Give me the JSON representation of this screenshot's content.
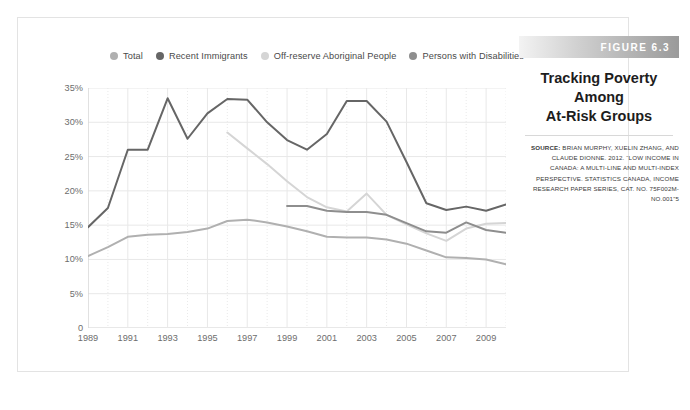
{
  "figure": {
    "band_label": "FIGURE 6.3",
    "title_line1": "Tracking Poverty Among",
    "title_line2": "At-Risk Groups",
    "source_prefix": "SOURCE:",
    "source_text": " BRIAN MURPHY, XUELIN ZHANG, AND CLAUDE DIONNE. 2012. “LOW INCOME IN CANADA: A MULTI-LINE AND MULTI-INDEX PERSPECTIVE. STATISTICS CANADA, INCOME RESEARCH PAPER SERIES, CAT. NO. 75F002M-NO.001”5"
  },
  "colors": {
    "total": "#b0b0b0",
    "recent_immigrants": "#666666",
    "off_reserve": "#d5d5d5",
    "disabilities": "#8e8e8e",
    "grid": "#e8e8e8",
    "axis": "#d0d0d0",
    "tick_text": "#6d6d6d",
    "band_end": "#9a9a9a"
  },
  "legend": [
    {
      "label": "Total",
      "color": "#b0b0b0"
    },
    {
      "label": "Recent Immigrants",
      "color": "#666666"
    },
    {
      "label": "Off-reserve Aboriginal People",
      "color": "#d5d5d5"
    },
    {
      "label": "Persons with Disabilities",
      "color": "#8e8e8e"
    }
  ],
  "chart_data": {
    "type": "line",
    "title": "Tracking Poverty Among At-Risk Groups",
    "xlabel": "",
    "ylabel": "",
    "xlim": [
      1989,
      2010
    ],
    "ylim": [
      0,
      35
    ],
    "ytick_labels": [
      "0",
      "5%",
      "10%",
      "15%",
      "20%",
      "25%",
      "30%",
      "35%"
    ],
    "ytick_values": [
      0,
      5,
      10,
      15,
      20,
      25,
      30,
      35
    ],
    "xtick_labels": [
      "1989",
      "1991",
      "1993",
      "1995",
      "1997",
      "1999",
      "2001",
      "2003",
      "2005",
      "2007",
      "2009"
    ],
    "xtick_values": [
      1989,
      1991,
      1993,
      1995,
      1997,
      1999,
      2001,
      2003,
      2005,
      2007,
      2009
    ],
    "grid": true,
    "legend_position": "top",
    "x": [
      1989,
      1990,
      1991,
      1992,
      1993,
      1994,
      1995,
      1996,
      1997,
      1998,
      1999,
      2000,
      2001,
      2002,
      2003,
      2004,
      2005,
      2006,
      2007,
      2008,
      2009,
      2010
    ],
    "series": [
      {
        "name": "Total",
        "color": "#b0b0b0",
        "values": [
          10.5,
          11.8,
          13.3,
          13.6,
          13.7,
          14.0,
          14.5,
          15.6,
          15.8,
          15.4,
          14.8,
          14.1,
          13.3,
          13.2,
          13.2,
          12.9,
          12.3,
          11.3,
          10.3,
          10.2,
          10.0,
          9.3
        ]
      },
      {
        "name": "Recent Immigrants",
        "color": "#666666",
        "values": [
          14.7,
          17.5,
          26.0,
          26.0,
          33.5,
          27.6,
          31.3,
          33.4,
          33.3,
          30.0,
          27.4,
          26.0,
          28.3,
          33.1,
          33.1,
          30.1,
          24.2,
          18.2,
          17.2,
          17.7,
          17.1,
          18.0
        ]
      },
      {
        "name": "Off-reserve Aboriginal People",
        "color": "#d5d5d5",
        "values": [
          null,
          null,
          null,
          null,
          null,
          null,
          null,
          28.5,
          26.2,
          23.9,
          21.4,
          19.1,
          17.6,
          17.0,
          19.6,
          16.5,
          15.1,
          13.8,
          12.7,
          14.5,
          15.2,
          15.3
        ]
      },
      {
        "name": "Persons with Disabilities",
        "color": "#8e8e8e",
        "values": [
          null,
          null,
          null,
          null,
          null,
          null,
          null,
          null,
          null,
          null,
          17.8,
          17.8,
          17.1,
          16.9,
          16.9,
          16.5,
          15.3,
          14.1,
          13.9,
          15.4,
          14.3,
          13.9
        ]
      }
    ]
  }
}
